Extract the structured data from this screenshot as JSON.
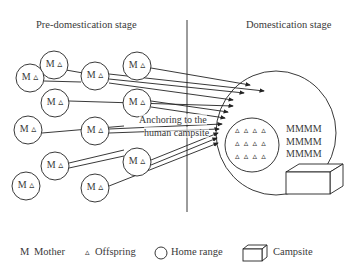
{
  "diagram": {
    "left_stage_title": "Pre-domestication stage",
    "right_stage_title": "Domestication stage",
    "arrow_label_line1": "Anchoring to the",
    "arrow_label_line2": "human campsite",
    "home_range_node_label": "M ▵",
    "mother_rows": [
      "MMMM",
      "MMMM",
      "MMMM"
    ],
    "offspring_rows": [
      "▵ ▵ ▵ ▵",
      "▵ ▵ ▵ ▵",
      "▵ ▵ ▵ ▵"
    ],
    "nodes": [
      {
        "x": 54,
        "y": 65
      },
      {
        "x": 30,
        "y": 78
      },
      {
        "x": 95,
        "y": 76
      },
      {
        "x": 137,
        "y": 66
      },
      {
        "x": 55,
        "y": 103
      },
      {
        "x": 137,
        "y": 103
      },
      {
        "x": 28,
        "y": 130
      },
      {
        "x": 95,
        "y": 131
      },
      {
        "x": 55,
        "y": 166
      },
      {
        "x": 137,
        "y": 162
      },
      {
        "x": 26,
        "y": 186
      },
      {
        "x": 95,
        "y": 188
      }
    ]
  },
  "legend": {
    "mother_symbol": "M",
    "mother_label": "Mother",
    "offspring_symbol": "▵",
    "offspring_label": "Offspring",
    "home_range_label": "Home range",
    "campsite_label": "Campsite"
  }
}
